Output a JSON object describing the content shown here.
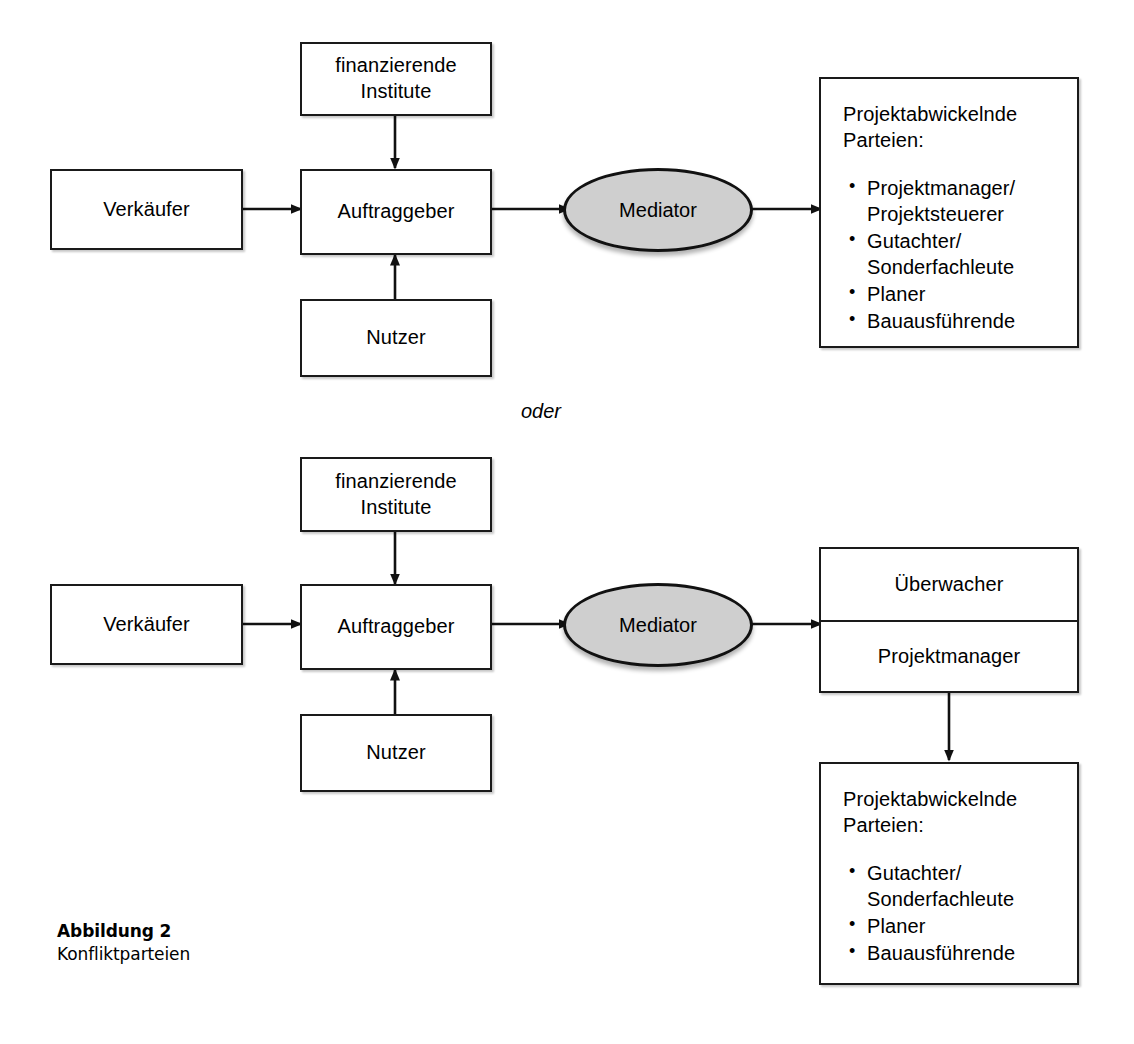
{
  "figure": {
    "caption_title": "Abbildung 2",
    "caption_subtitle": "Konfliktparteien",
    "connector_label": "oder"
  },
  "colors": {
    "stroke": "#1a1a1a",
    "mediator_fill": "#cfcfcf",
    "background": "#ffffff"
  },
  "variant_a": {
    "financing": {
      "line1": "finanzierende",
      "line2": "Institute"
    },
    "seller": {
      "label": "Verkäufer"
    },
    "client": {
      "label": "Auftraggeber"
    },
    "user": {
      "label": "Nutzer"
    },
    "mediator": {
      "label": "Mediator"
    },
    "parties": {
      "heading_line1": "Projektabwickelnde",
      "heading_line2": "Parteien:",
      "items": [
        "Projektmanager/\nProjektsteuerer",
        "Gutachter/\nSonderfachleute",
        "Planer",
        "Bauausführende"
      ]
    }
  },
  "variant_b": {
    "financing": {
      "line1": "finanzierende",
      "line2": "Institute"
    },
    "seller": {
      "label": "Verkäufer"
    },
    "client": {
      "label": "Auftraggeber"
    },
    "user": {
      "label": "Nutzer"
    },
    "mediator": {
      "label": "Mediator"
    },
    "supervisor_stack": {
      "cell1": "Überwacher",
      "cell2": "Projektmanager"
    },
    "parties": {
      "heading_line1": "Projektabwickelnde",
      "heading_line2": "Parteien:",
      "items": [
        "Gutachter/\nSonderfachleute",
        "Planer",
        "Bauausführende"
      ]
    }
  }
}
